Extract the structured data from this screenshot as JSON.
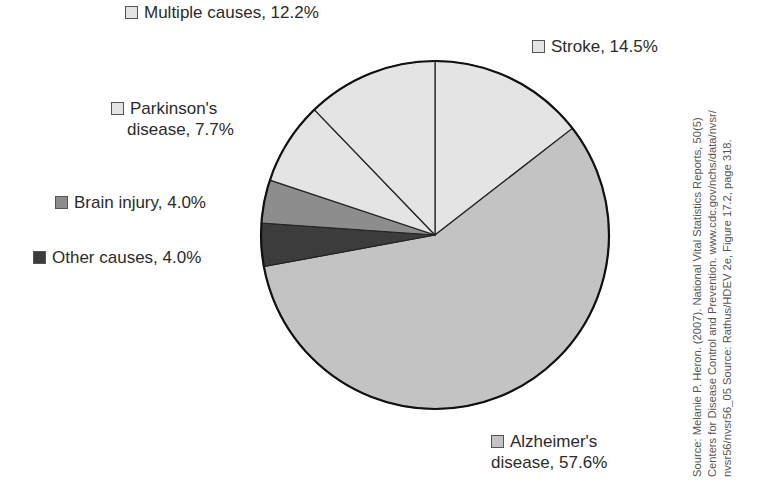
{
  "chart_data": {
    "type": "pie",
    "title": "",
    "start_angle": "12 o'clock, clockwise",
    "slices": [
      {
        "label": "Stroke",
        "value": 14.5,
        "color": "#e4e4e4"
      },
      {
        "label": "Alzheimer's disease",
        "value": 57.6,
        "color": "#c3c3c3"
      },
      {
        "label": "Other causes",
        "value": 4.0,
        "color": "#3c3c3c"
      },
      {
        "label": "Brain injury",
        "value": 4.0,
        "color": "#8d8d8d"
      },
      {
        "label": "Parkinson's disease",
        "value": 7.7,
        "color": "#e4e4e4"
      },
      {
        "label": "Multiple causes",
        "value": 12.2,
        "color": "#e4e4e4"
      }
    ],
    "units": "%",
    "legend_position": "labels around pie"
  },
  "labels": {
    "stroke": "Stroke, 14.5%",
    "alzheimers_line1": "Alzheimer's",
    "alzheimers_line2": "disease, 57.6%",
    "other": "Other causes, 4.0%",
    "brain": "Brain injury, 4.0%",
    "parkinsons_line1": "Parkinson's",
    "parkinsons_line2": "disease, 7.7%",
    "multiple": "Multiple causes, 12.2%"
  },
  "source": {
    "line1": "Source: Melanie P. Heron. (2007). National Vital Statistics Reports, 50(5)",
    "line2": "Centers for Disease Control and Prevention. www.cdc.gov/nchs/data/nvsr/",
    "line3": "nvsr56/nvsr56_05 Source: Rathus/HDEV 2e, Figure 17.2, page 318."
  }
}
